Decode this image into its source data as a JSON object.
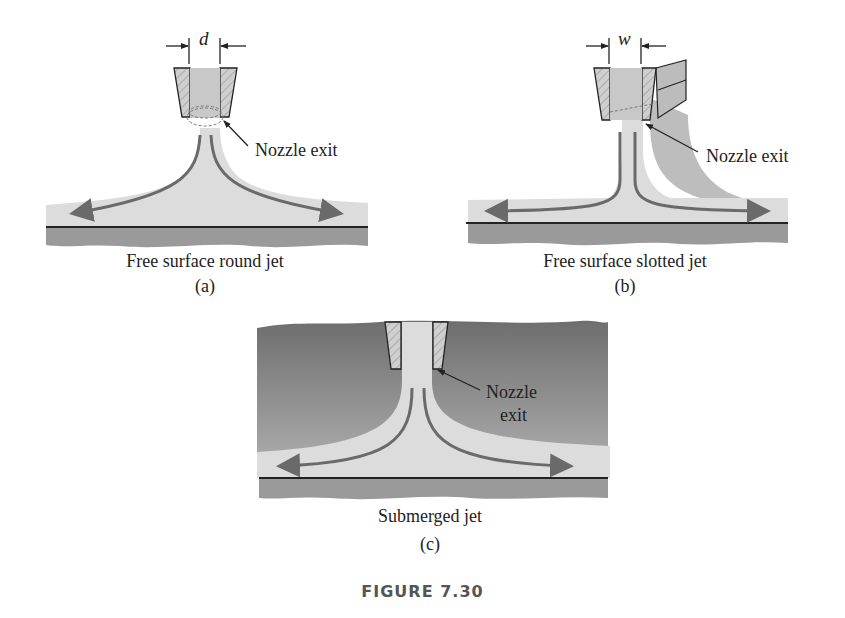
{
  "figure": {
    "title": "FIGURE 7.30"
  },
  "panels": [
    {
      "id": "a",
      "caption": "Free surface round jet",
      "letter": "(a)",
      "dimension_label": "d",
      "callout": "Nozzle exit"
    },
    {
      "id": "b",
      "caption": "Free surface slotted jet",
      "letter": "(b)",
      "dimension_label": "w",
      "callout": "Nozzle exit"
    },
    {
      "id": "c",
      "caption": "Submerged jet",
      "letter": "(c)",
      "callout_line1": "Nozzle",
      "callout_line2": "exit"
    }
  ],
  "colors": {
    "fluid_light": "#dcdcdc",
    "fluid_mid": "#bdbdbd",
    "surroundings_dark": "#7e7e7e",
    "plate": "#9a9a9a",
    "streamline": "#6a6a6a",
    "outline": "#222222",
    "title_text": "#555555"
  }
}
